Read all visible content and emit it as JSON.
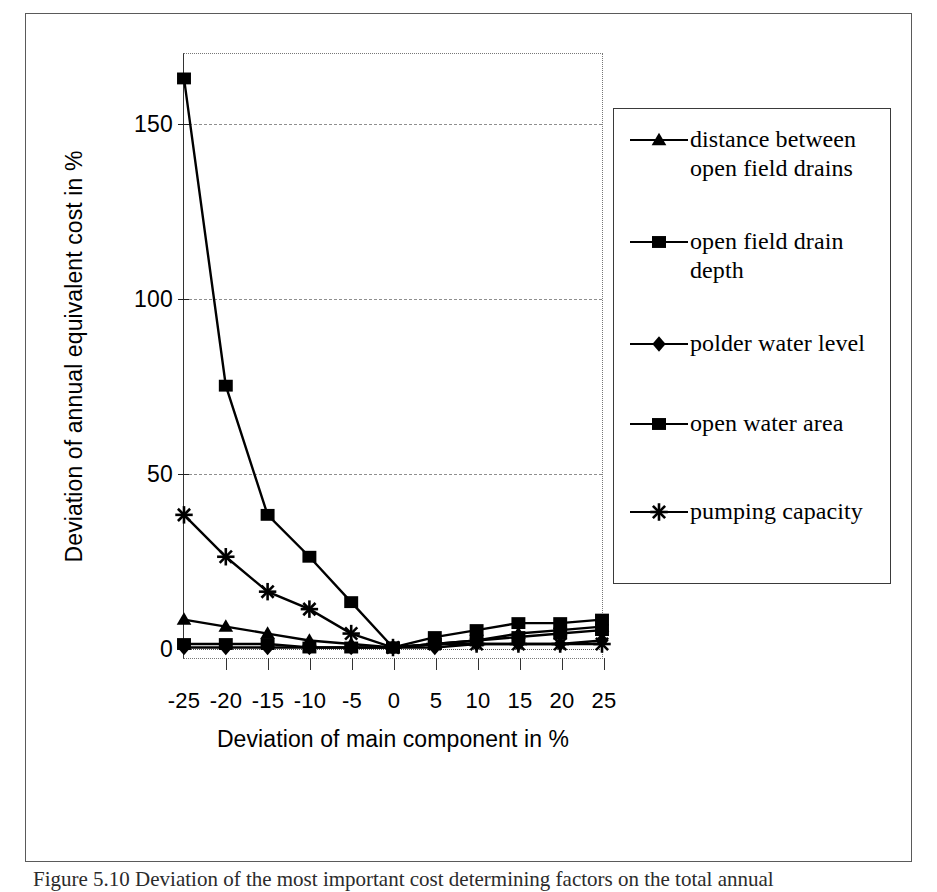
{
  "figure": {
    "caption": "Figure 5.10 Deviation of the most important cost determining factors on the total annual"
  },
  "chart_data": {
    "type": "line",
    "title": "",
    "xlabel": "Deviation of main component in %",
    "ylabel": "Deviation of annual equivalent cost in %",
    "x": [
      -25,
      -20,
      -15,
      -10,
      -5,
      0,
      5,
      10,
      15,
      20,
      25
    ],
    "xticklabels": [
      "-25",
      "-20",
      "-15",
      "-10",
      "-5",
      "0",
      "5",
      "10",
      "15",
      "20",
      "25"
    ],
    "yticklabels": [
      "0",
      "50",
      "100",
      "150"
    ],
    "yticks": [
      0,
      50,
      100,
      150
    ],
    "xlim": [
      -25,
      25
    ],
    "ylim": [
      -3,
      170
    ],
    "grid": "horizontal-dashed",
    "legend_position": "right-outside",
    "series": [
      {
        "name": "distance between open field drains",
        "marker": "triangle",
        "values": [
          8,
          6,
          4,
          2,
          1,
          0,
          1,
          2,
          4,
          5,
          6
        ]
      },
      {
        "name": "open field drain depth",
        "marker": "square",
        "values": [
          163,
          75,
          38,
          26,
          13,
          0,
          3,
          5,
          7,
          7,
          8
        ]
      },
      {
        "name": "polder water level",
        "marker": "diamond",
        "values": [
          0,
          0,
          0,
          0,
          0,
          0,
          0,
          1,
          1,
          1,
          2
        ]
      },
      {
        "name": "open water area",
        "marker": "square",
        "values": [
          1,
          1,
          1,
          0,
          0,
          0,
          1,
          2,
          3,
          4,
          5
        ]
      },
      {
        "name": "pumping capacity",
        "marker": "star",
        "values": [
          38,
          26,
          16,
          11,
          4,
          0,
          1,
          1,
          1,
          1,
          1
        ]
      }
    ]
  },
  "legend": {
    "items": [
      {
        "label": "distance between open field drains",
        "marker": "triangle"
      },
      {
        "label": "open field drain depth",
        "marker": "square"
      },
      {
        "label": "polder water level",
        "marker": "diamond"
      },
      {
        "label": "open water area",
        "marker": "square"
      },
      {
        "label": "pumping capacity",
        "marker": "star"
      }
    ]
  },
  "colors": {
    "line": "#000000",
    "grid": "#8f8f8f",
    "frame": "#5a5a5a"
  }
}
